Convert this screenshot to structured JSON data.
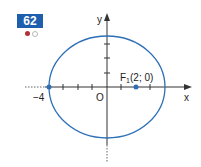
{
  "exercise": {
    "number": "62",
    "difficulty_dots": [
      "filled",
      "empty"
    ]
  },
  "diagram": {
    "axis_x_label": "x",
    "axis_y_label": "y",
    "origin_label": "O",
    "left_vertex_label": "−4",
    "focus_label_main": "F",
    "focus_label_sub": "1",
    "focus_label_coords": "(2; 0)",
    "ellipse": {
      "a": 4,
      "b": 3.46,
      "center": [
        0,
        0
      ]
    },
    "focus": [
      2,
      0
    ],
    "colors": {
      "curve": "#2d6fb7",
      "axes": "#333333",
      "badge": "#1d5fae"
    }
  }
}
